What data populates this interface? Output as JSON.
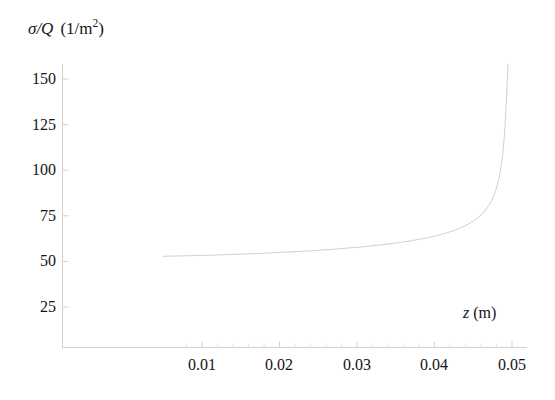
{
  "chart_data": {
    "type": "line",
    "title": "",
    "subtitle": "",
    "xlabel_symbol": "z",
    "xlabel_units": "(m)",
    "ylabel_symbol": "σ/Q",
    "ylabel_units": "(1/m²)",
    "xlabel": "z (m)",
    "ylabel": "σ/Q (1/m^2)",
    "grid": false,
    "legend": null,
    "legend_position": "none",
    "xlim": [
      0.0,
      0.0515
    ],
    "ylim": [
      0,
      163
    ],
    "xticks": [
      0.01,
      0.02,
      0.03,
      0.04,
      0.05
    ],
    "xtick_labels": [
      "0.01",
      "0.02",
      "0.03",
      "0.04",
      "0.05"
    ],
    "yticks": [
      25,
      50,
      75,
      100,
      125,
      150
    ],
    "ytick_labels": [
      "25",
      "50",
      "75",
      "100",
      "125",
      "150"
    ],
    "series": [
      {
        "name": "sigma over Q",
        "color": "#c9c9c9",
        "linewidth": 0.9,
        "x": [
          0.005,
          0.006,
          0.007,
          0.008,
          0.009,
          0.01,
          0.011,
          0.012,
          0.013,
          0.014,
          0.015,
          0.016,
          0.017,
          0.018,
          0.019,
          0.02,
          0.021,
          0.022,
          0.023,
          0.024,
          0.025,
          0.026,
          0.027,
          0.028,
          0.029,
          0.03,
          0.031,
          0.032,
          0.033,
          0.034,
          0.035,
          0.036,
          0.037,
          0.038,
          0.039,
          0.04,
          0.041,
          0.042,
          0.043,
          0.044,
          0.045,
          0.0455,
          0.046,
          0.0465,
          0.047,
          0.0473,
          0.0476,
          0.0479,
          0.0482,
          0.0484,
          0.0486,
          0.0488,
          0.0489,
          0.049,
          0.0491,
          0.0492,
          0.0493,
          0.0494,
          0.0495
        ],
        "y": [
          52.8,
          52.9,
          53.0,
          53.1,
          53.2,
          53.3,
          53.4,
          53.5,
          53.7,
          53.8,
          54.0,
          54.1,
          54.3,
          54.5,
          54.7,
          54.9,
          55.1,
          55.3,
          55.6,
          55.8,
          56.1,
          56.4,
          56.7,
          57.0,
          57.4,
          57.7,
          58.1,
          58.6,
          59.0,
          59.5,
          60.1,
          60.7,
          61.3,
          62.1,
          62.9,
          63.8,
          64.9,
          66.2,
          67.7,
          69.6,
          72.1,
          73.6,
          75.4,
          77.7,
          80.6,
          82.8,
          85.5,
          88.9,
          93.4,
          97.2,
          102.0,
          108.5,
          112.8,
          118.0,
          124.5,
          132.0,
          140.5,
          150.0,
          160.5
        ]
      }
    ],
    "annotations": [],
    "axis": {
      "color": "#d2d2d2",
      "spines": [
        "left",
        "bottom"
      ],
      "tick_direction": "out"
    }
  },
  "figure": {
    "background": "#ffffff",
    "text_color": "#151515"
  }
}
